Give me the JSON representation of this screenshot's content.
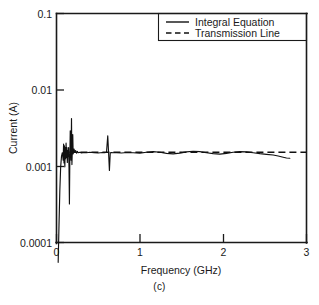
{
  "figure": {
    "caption": "(c)"
  },
  "chart_data": {
    "type": "line",
    "title": "",
    "xlabel": "Frequency (GHz)",
    "ylabel": "Current (A)",
    "xlim": [
      0,
      3
    ],
    "ylim": [
      0.0001,
      0.1
    ],
    "yscale": "log",
    "xscale": "linear",
    "grid": false,
    "legend_position": "top-right",
    "xticks": [
      0,
      1,
      2,
      3
    ],
    "xticklabels": [
      "0",
      "1",
      "2",
      "3"
    ],
    "yticks": [
      0.0001,
      0.001,
      0.01,
      0.1
    ],
    "yticklabels": [
      "0.0001",
      "0.001",
      "0.01",
      "0.1"
    ],
    "series": [
      {
        "name": "Integral Equation",
        "style": "solid",
        "color": "#111111",
        "x": [
          0.02,
          0.03,
          0.04,
          0.05,
          0.06,
          0.07,
          0.08,
          0.085,
          0.09,
          0.095,
          0.1,
          0.105,
          0.11,
          0.115,
          0.12,
          0.125,
          0.13,
          0.135,
          0.14,
          0.145,
          0.15,
          0.155,
          0.16,
          0.165,
          0.17,
          0.175,
          0.18,
          0.185,
          0.19,
          0.195,
          0.2,
          0.21,
          0.22,
          0.23,
          0.24,
          0.25,
          0.26,
          0.28,
          0.3,
          0.33,
          0.36,
          0.4,
          0.45,
          0.5,
          0.55,
          0.58,
          0.6,
          0.615,
          0.625,
          0.635,
          0.645,
          0.66,
          0.68,
          0.72,
          0.78,
          0.85,
          0.92,
          1.0,
          1.08,
          1.16,
          1.24,
          1.32,
          1.4,
          1.48,
          1.56,
          1.64,
          1.72,
          1.8,
          1.88,
          1.96,
          2.04,
          2.12,
          2.2,
          2.28,
          2.36,
          2.44,
          2.52,
          2.6,
          2.66,
          2.72,
          2.76,
          2.8
        ],
        "y": [
          5.5e-05,
          0.00017,
          0.00048,
          0.00098,
          0.00135,
          0.0015,
          0.0012,
          0.00195,
          0.0011,
          0.00185,
          0.00098,
          0.00175,
          0.00125,
          0.002,
          0.0013,
          0.00175,
          0.00112,
          0.0016,
          0.00135,
          0.00175,
          0.00098,
          0.00032,
          0.00125,
          0.0029,
          0.00175,
          0.0012,
          0.0042,
          0.00105,
          0.00165,
          0.0026,
          0.00145,
          0.00168,
          0.00152,
          0.0016,
          0.00148,
          0.00156,
          0.0015,
          0.00152,
          0.00149,
          0.00151,
          0.0015,
          0.00152,
          0.0015,
          0.00149,
          0.00151,
          0.0015,
          0.00152,
          0.0025,
          0.0015,
          0.00088,
          0.0015,
          0.00151,
          0.0015,
          0.0015,
          0.00149,
          0.00151,
          0.0015,
          0.00148,
          0.00152,
          0.00155,
          0.00152,
          0.00147,
          0.00145,
          0.00148,
          0.00154,
          0.00157,
          0.00155,
          0.0015,
          0.00146,
          0.00144,
          0.00147,
          0.00152,
          0.00155,
          0.00154,
          0.0015,
          0.00146,
          0.00143,
          0.0014,
          0.00136,
          0.00131,
          0.00128,
          0.00127
        ]
      },
      {
        "name": "Transmission Line",
        "style": "dashed",
        "color": "#111111",
        "x": [
          0.155,
          3.0
        ],
        "y": [
          0.00152,
          0.00152
        ]
      }
    ]
  },
  "legend": {
    "entries": [
      {
        "label": "Integral Equation",
        "style": "solid"
      },
      {
        "label": "Transmission Line",
        "style": "dashed"
      }
    ]
  }
}
